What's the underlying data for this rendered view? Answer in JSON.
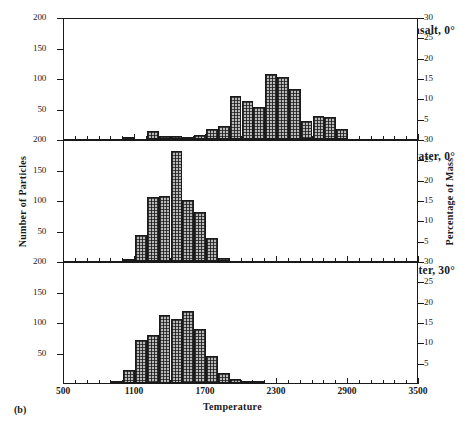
{
  "figure": {
    "subfigure_label": "(b)",
    "x_axis": {
      "title": "Temperature",
      "ticks": [
        500,
        1100,
        1700,
        2300,
        2900,
        3500
      ],
      "min": 500,
      "max": 3500,
      "minor_step": 100
    },
    "y_axis_left": {
      "title": "Number of Particles",
      "ticks": [
        50,
        100,
        150,
        200
      ],
      "min": 0,
      "max": 200
    },
    "y_axis_right": {
      "title": "Percentage of Mass",
      "ticks": [
        5,
        10,
        15,
        20,
        25,
        30
      ],
      "min": 0,
      "max": 30
    }
  },
  "chart_data": [
    {
      "type": "bar",
      "title": "Comet into basalt, 0°",
      "panel_index": 0,
      "xlabel": "Temperature",
      "ylabel": "Number of Particles",
      "ylabel_right": "Percentage of Mass",
      "xlim": [
        500,
        3500
      ],
      "ylim": [
        0,
        200
      ],
      "ylim_right": [
        0,
        30
      ],
      "bin_width": 100,
      "grid": false,
      "bin_starts": [
        1000,
        1200,
        1300,
        1400,
        1500,
        1600,
        1700,
        1800,
        1900,
        2000,
        2100,
        2200,
        2300,
        2400,
        2500,
        2600,
        2700
      ],
      "values": [
        4,
        13,
        5,
        5,
        3,
        7,
        17,
        22,
        70,
        63,
        52,
        106,
        101,
        82,
        30,
        38,
        36,
        17
      ],
      "categories": [
        "1000",
        "1200",
        "1300",
        "1400",
        "1500",
        "1600",
        "1700",
        "1800",
        "1900",
        "2000",
        "2100",
        "2200",
        "2300",
        "2400",
        "2500",
        "2600",
        "2700",
        "2800"
      ]
    },
    {
      "type": "bar",
      "title": "Comet into water, 0°",
      "panel_index": 1,
      "xlabel": "Temperature",
      "ylabel": "Number of Particles",
      "ylabel_right": "Percentage of Mass",
      "xlim": [
        500,
        3500
      ],
      "ylim": [
        0,
        200
      ],
      "ylim_right": [
        0,
        30
      ],
      "bin_width": 100,
      "grid": false,
      "bin_starts": [
        1000,
        1100,
        1200,
        1300,
        1400,
        1500,
        1600,
        1700,
        1800
      ],
      "values": [
        4,
        42,
        105,
        107,
        181,
        100,
        80,
        37,
        5
      ],
      "categories": [
        "1000",
        "1100",
        "1200",
        "1300",
        "1400",
        "1500",
        "1600",
        "1700",
        "1800"
      ]
    },
    {
      "type": "bar",
      "title": "Comet into water, 30°",
      "panel_index": 2,
      "xlabel": "Temperature",
      "ylabel": "Number of Particles",
      "ylabel_right": "Percentage of Mass",
      "xlim": [
        500,
        3500
      ],
      "ylim": [
        0,
        200
      ],
      "ylim_right": [
        0,
        30
      ],
      "bin_width": 100,
      "grid": false,
      "bin_starts": [
        900,
        1000,
        1100,
        1200,
        1300,
        1400,
        1500,
        1600,
        1700,
        1800,
        1900,
        2000,
        2100
      ],
      "values": [
        2,
        22,
        70,
        78,
        111,
        105,
        118,
        88,
        44,
        17,
        7,
        4,
        2
      ],
      "categories": [
        "900",
        "1000",
        "1100",
        "1200",
        "1300",
        "1400",
        "1500",
        "1600",
        "1700",
        "1800",
        "1900",
        "2000",
        "2100"
      ]
    }
  ]
}
